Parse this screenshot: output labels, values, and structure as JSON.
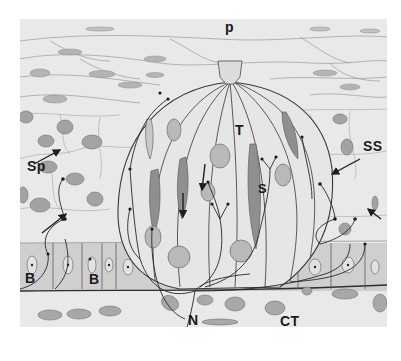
{
  "figure": {
    "labels": {
      "pore": "p",
      "taste_cell": "T",
      "sustentacular_cell": "S",
      "spinous_layer": "Sp",
      "stratum_spinosum": "SS",
      "basal_left": "B",
      "basal_mid": "B",
      "nerve": "N",
      "connective_tissue": "CT"
    },
    "colors": {
      "background": "#e9e9e9",
      "line": "#3a3a3a",
      "nucleus_fill": "#a9a9a9",
      "page": "#ffffff"
    }
  }
}
